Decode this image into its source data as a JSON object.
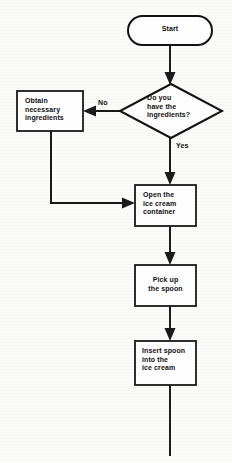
{
  "diagram": {
    "type": "flowchart",
    "orientation": "top-to-bottom",
    "background_color": "#fbfbfa",
    "line_color": "#1a1a1a",
    "node_fill_color": "#ffffff"
  },
  "nodes": {
    "start": {
      "label": "Start",
      "shape": "stadium",
      "text_align": "center"
    },
    "decision": {
      "label": "Do you\nhave the\ningredients?",
      "shape": "diamond",
      "text_align": "left"
    },
    "obtain": {
      "label": "Obtain\nnecessary\ningredients",
      "shape": "rectangle",
      "text_align": "left"
    },
    "open_container": {
      "label": "Open the\nice cream\ncontainer",
      "shape": "rectangle",
      "text_align": "left"
    },
    "pick_spoon": {
      "label": "Pick up\nthe spoon",
      "shape": "rectangle",
      "text_align": "center"
    },
    "insert_spoon": {
      "label": "Insert spoon\ninto the\nice cream",
      "shape": "rectangle",
      "text_align": "left"
    }
  },
  "edges": {
    "start_to_decision": {
      "label": "",
      "from": "start",
      "to": "decision"
    },
    "decision_no": {
      "label": "No",
      "from": "decision",
      "to": "obtain"
    },
    "decision_yes": {
      "label": "Yes",
      "from": "decision",
      "to": "open_container"
    },
    "obtain_to_open": {
      "label": "",
      "from": "obtain",
      "to": "open_container"
    },
    "open_to_pick": {
      "label": "",
      "from": "open_container",
      "to": "pick_spoon"
    },
    "pick_to_insert": {
      "label": "",
      "from": "pick_spoon",
      "to": "insert_spoon"
    },
    "insert_tail": {
      "label": "",
      "from": "insert_spoon",
      "to": ""
    }
  }
}
